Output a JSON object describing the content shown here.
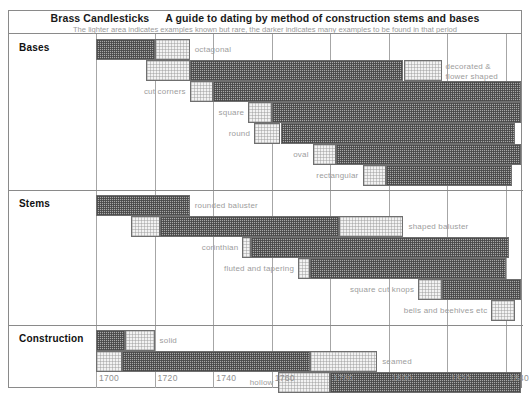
{
  "header": {
    "title_main": "Brass Candlesticks",
    "title_sub": "A guide to dating by method of construction stems and bases",
    "note": "The lighter area indicates examples known but rare, the darker indicates many examples to be found in that period"
  },
  "colors": {
    "dark_fill": "#a8a8a8",
    "light_fill": "#f2f2f2",
    "border": "#6f6f6f",
    "frame": "#8a8a8a",
    "label_text": "#9d9d9d",
    "axis_text": "#8f8f8f"
  },
  "axis": {
    "ticks": [
      1700,
      1720,
      1740,
      1760,
      1780,
      1800,
      1820,
      1840
    ],
    "min": 1700,
    "max": 1845
  },
  "chart_data": {
    "type": "bar",
    "subtitle": "The lighter area indicates examples known but rare, the darker indicates many examples to be found in that period",
    "xlabel": "Year",
    "ylabel": "",
    "xlim": [
      1700,
      1845
    ],
    "grid": true,
    "legend": [
      "lighter = known but rare",
      "darker = many examples"
    ],
    "orientation": "horizontal-timeline",
    "sections": [
      {
        "name": "Bases",
        "rows": [
          {
            "label": "octagonal",
            "segments": [
              {
                "shade": "dark",
                "start": 1700,
                "end": 1720
              },
              {
                "shade": "light",
                "start": 1720,
                "end": 1732
              }
            ]
          },
          {
            "label": "decorated & flower shaped",
            "segments": [
              {
                "shade": "light",
                "start": 1717,
                "end": 1732
              },
              {
                "shade": "dark",
                "start": 1732,
                "end": 1805
              },
              {
                "shade": "light",
                "start": 1805,
                "end": 1818
              }
            ]
          },
          {
            "label": "cut corners",
            "segments": [
              {
                "shade": "light",
                "start": 1732,
                "end": 1740
              },
              {
                "shade": "dark",
                "start": 1740,
                "end": 1845
              }
            ]
          },
          {
            "label": "square",
            "segments": [
              {
                "shade": "light",
                "start": 1752,
                "end": 1760
              },
              {
                "shade": "dark",
                "start": 1760,
                "end": 1845
              }
            ]
          },
          {
            "label": "round",
            "segments": [
              {
                "shade": "light",
                "start": 1754,
                "end": 1763
              },
              {
                "shade": "dark",
                "start": 1763,
                "end": 1843
              }
            ]
          },
          {
            "label": "oval",
            "segments": [
              {
                "shade": "light",
                "start": 1774,
                "end": 1782
              },
              {
                "shade": "dark",
                "start": 1782,
                "end": 1845
              }
            ]
          },
          {
            "label": "rectangular",
            "segments": [
              {
                "shade": "light",
                "start": 1791,
                "end": 1799
              },
              {
                "shade": "dark",
                "start": 1799,
                "end": 1842
              }
            ]
          }
        ]
      },
      {
        "name": "Stems",
        "rows": [
          {
            "label": "rounded baluster",
            "segments": [
              {
                "shade": "dark",
                "start": 1700,
                "end": 1732
              }
            ]
          },
          {
            "label": "shaped baluster",
            "segments": [
              {
                "shade": "light",
                "start": 1712,
                "end": 1722
              },
              {
                "shade": "dark",
                "start": 1722,
                "end": 1783
              },
              {
                "shade": "light",
                "start": 1783,
                "end": 1805
              }
            ]
          },
          {
            "label": "corinthian",
            "segments": [
              {
                "shade": "light",
                "start": 1750,
                "end": 1753
              },
              {
                "shade": "dark",
                "start": 1753,
                "end": 1841
              }
            ]
          },
          {
            "label": "fluted and tapering",
            "segments": [
              {
                "shade": "light",
                "start": 1769,
                "end": 1773
              },
              {
                "shade": "dark",
                "start": 1773,
                "end": 1840
              }
            ]
          },
          {
            "label": "square cut knops",
            "segments": [
              {
                "shade": "light",
                "start": 1810,
                "end": 1818
              },
              {
                "shade": "dark",
                "start": 1818,
                "end": 1845
              }
            ]
          },
          {
            "label": "bells and beehives etc",
            "segments": [
              {
                "shade": "light",
                "start": 1835,
                "end": 1843
              }
            ]
          }
        ]
      },
      {
        "name": "Construction",
        "rows": [
          {
            "label": "solid",
            "segments": [
              {
                "shade": "dark",
                "start": 1700,
                "end": 1710
              },
              {
                "shade": "light",
                "start": 1710,
                "end": 1720
              }
            ]
          },
          {
            "label": "seamed",
            "segments": [
              {
                "shade": "light",
                "start": 1700,
                "end": 1709
              },
              {
                "shade": "dark",
                "start": 1709,
                "end": 1773
              },
              {
                "shade": "light",
                "start": 1773,
                "end": 1796
              }
            ]
          },
          {
            "label": "hollow",
            "segments": [
              {
                "shade": "light",
                "start": 1762,
                "end": 1780
              },
              {
                "shade": "dark",
                "start": 1780,
                "end": 1845
              }
            ]
          }
        ]
      }
    ]
  }
}
